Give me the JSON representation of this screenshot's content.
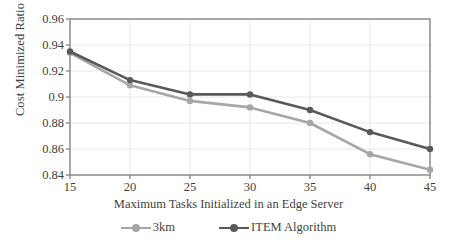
{
  "chart_data": {
    "type": "line",
    "title": "",
    "xlabel": "Maximum Tasks Initialized in an Edge Server",
    "ylabel": "Cost Minimized Ratio",
    "categories": [
      15,
      20,
      25,
      30,
      35,
      40,
      45
    ],
    "x_tick_labels": [
      "15",
      "20",
      "25",
      "30",
      "35",
      "40",
      "45"
    ],
    "y_tick_labels": [
      "0.96",
      "0.94",
      "0.92",
      "0.9",
      "0.88",
      "0.86",
      "0.84"
    ],
    "y_tick_values": [
      0.96,
      0.94,
      0.92,
      0.9,
      0.88,
      0.86,
      0.84
    ],
    "ylim": [
      0.84,
      0.96
    ],
    "xlim": [
      15,
      45
    ],
    "grid": true,
    "legend_position": "bottom",
    "series": [
      {
        "name": "3km",
        "color": "#a6a6a6",
        "marker": "circle",
        "values": [
          0.934,
          0.909,
          0.897,
          0.892,
          0.88,
          0.856,
          0.844
        ]
      },
      {
        "name": "ITEM Algorithm",
        "color": "#595959",
        "marker": "circle",
        "values": [
          0.935,
          0.913,
          0.902,
          0.902,
          0.89,
          0.873,
          0.86
        ]
      }
    ]
  },
  "colors": {
    "axis": "#808080",
    "grid": "#e8e8e8",
    "text": "#3f3f3f",
    "series_light": "#a6a6a6",
    "series_dark": "#595959",
    "background": "#ffffff"
  },
  "legend": {
    "items": [
      {
        "label": "3km",
        "color": "#a6a6a6"
      },
      {
        "label": "ITEM Algorithm",
        "color": "#595959"
      }
    ]
  }
}
